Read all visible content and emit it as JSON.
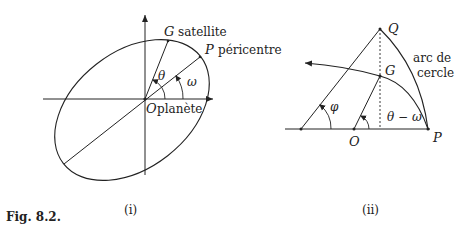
{
  "figure": {
    "caption": "Fig. 8.2.",
    "panels": [
      {
        "id": "i",
        "label": "(i)",
        "points": {
          "G": {
            "letter": "G",
            "text": "satellite"
          },
          "P": {
            "letter": "P",
            "text": "péricentre"
          },
          "O": {
            "letter": "O",
            "text": "planète"
          }
        },
        "angles": {
          "theta": "θ",
          "omega": "ω"
        }
      },
      {
        "id": "ii",
        "label": "(ii)",
        "points": {
          "Q": {
            "letter": "Q"
          },
          "G": {
            "letter": "G"
          },
          "O": {
            "letter": "O"
          },
          "P": {
            "letter": "P"
          }
        },
        "angles": {
          "phi": "φ",
          "theta_minus_omega": "θ − ω"
        },
        "annotation": {
          "line1": "arc de",
          "line2": "cercle"
        }
      }
    ]
  },
  "colors": {
    "ink": "#222222",
    "background": "#ffffff"
  }
}
